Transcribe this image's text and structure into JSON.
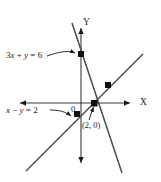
{
  "chart_data": {
    "type": "line",
    "title": "",
    "xlabel": "X",
    "ylabel": "Y",
    "grid": false,
    "legend": "none",
    "xlim": [
      -4,
      6
    ],
    "ylim": [
      -8,
      9
    ],
    "series": [
      {
        "name": "3x + y = 6",
        "label": "3x + y = 6",
        "slope": -3,
        "intercept": 6,
        "points": [
          {
            "x": 0,
            "y": 6,
            "marked": true
          },
          {
            "x": 2,
            "y": 0,
            "marked": true
          }
        ]
      },
      {
        "name": "x - y = 2",
        "label": "x − y = 2",
        "slope": 1,
        "intercept": -2,
        "points": [
          {
            "x": 0,
            "y": -2,
            "marked": true
          },
          {
            "x": 2,
            "y": 0,
            "marked": true
          },
          {
            "x": 4,
            "y": 2,
            "marked": true
          }
        ]
      }
    ],
    "intersection": {
      "x": 2,
      "y": 0,
      "label": "(2, 0)"
    },
    "annotations": [
      {
        "name": "line1-label",
        "text": "3x + y = 6",
        "target": "point (0, 6)"
      },
      {
        "name": "line2-label",
        "text": "x − y = 2",
        "target": "point (0, -2)"
      },
      {
        "name": "intersection-label",
        "text": "(2, 0)",
        "target": "point (2, 0)"
      },
      {
        "name": "origin-label",
        "text": "0",
        "target": "origin"
      }
    ]
  },
  "figure": {
    "axes": {
      "x_label": "X",
      "y_label": "Y",
      "origin_label": "0"
    },
    "labels": {
      "line1_prefix": "3",
      "line1_x": "x",
      "line1_plus": " + ",
      "line1_y": "y",
      "line1_eq": " = 6",
      "line1_full": "3x + y = 6",
      "line2_x": "x",
      "line2_minus": " − ",
      "line2_y": "y",
      "line2_eq": " = 2",
      "line2_full": "x − y = 2",
      "intersection": "(2, 0)"
    },
    "colors": {
      "ink": "#1a1a1a",
      "line": "#404040",
      "background": "#ffffff"
    }
  }
}
